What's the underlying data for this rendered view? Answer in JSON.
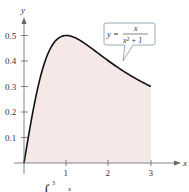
{
  "chart_data": {
    "type": "area",
    "title": "",
    "xlabel": "x",
    "ylabel": "y",
    "xlim": [
      0,
      3.5
    ],
    "ylim": [
      0,
      0.55
    ],
    "x_ticks": [
      "1",
      "2",
      "3"
    ],
    "y_ticks": [
      "0.1",
      "0.2",
      "0.3",
      "0.4",
      "0.5"
    ],
    "function": "y = x/(x^2+1)",
    "shaded_region": {
      "from": 0,
      "to": 3
    },
    "x": [
      0,
      0.25,
      0.5,
      0.75,
      1,
      1.25,
      1.5,
      1.75,
      2,
      2.25,
      2.5,
      2.75,
      3
    ],
    "values": [
      0,
      0.235,
      0.4,
      0.48,
      0.5,
      0.488,
      0.462,
      0.431,
      0.4,
      0.371,
      0.345,
      0.322,
      0.3
    ],
    "annotation": {
      "label_lhs": "y =",
      "numerator": "x",
      "denominator": "x² + 1"
    },
    "caption_partial": "∫₀³ x"
  },
  "labels": {
    "x_axis": "x",
    "y_axis": "y",
    "x1": "1",
    "x2": "2",
    "x3": "3",
    "y1": "0.1",
    "y2": "0.2",
    "y3": "0.3",
    "y4": "0.4",
    "y5": "0.5",
    "eq_lhs": "y =",
    "eq_num": "x",
    "eq_den": "x² + 1",
    "caption_integral": "∫",
    "caption_upper": "3",
    "caption_x": "x"
  },
  "colors": {
    "fill": "#f7e8e8",
    "curve": "#111111",
    "axis": "#555555",
    "callout_border": "#8aa4b0"
  }
}
